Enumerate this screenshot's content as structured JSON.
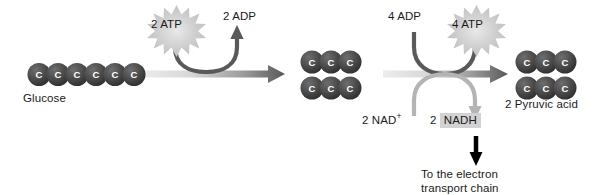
{
  "diagram": {
    "background_color": "#ffffff"
  },
  "molecules": {
    "glucose": {
      "name": "Glucose",
      "carbon_count": 6,
      "carbon_label": "C",
      "rows": 1
    },
    "intermediate": {
      "carbon_label": "C",
      "carbons_per_row": 3,
      "rows": 2
    },
    "pyruvic_acid": {
      "name": "2 Pyruvic acid",
      "carbon_label": "C",
      "carbons_per_row": 3,
      "rows": 2
    }
  },
  "reactions": {
    "atp_input": {
      "label": "2 ATP",
      "count": "2",
      "species": "ATP",
      "burst_color": "#c9c9c9"
    },
    "adp_output": {
      "label": "2 ADP",
      "count": "2",
      "species": "ADP"
    },
    "adp_input": {
      "label": "4 ADP",
      "count": "4",
      "species": "ADP"
    },
    "atp_output": {
      "label": "4 ATP",
      "count": "4",
      "species": "ATP",
      "burst_color": "#c9c9c9"
    },
    "nad_input": {
      "count": "2",
      "species": "NAD",
      "charge": "+",
      "label": "2 NAD+"
    },
    "nadh_output": {
      "count": "2",
      "species": "NADH",
      "label": "2 NADH",
      "highlight_color": "#d2d2d2"
    }
  },
  "annotations": {
    "electron_chain": {
      "line1": "To the electron",
      "line2": "transport chain"
    }
  },
  "colors": {
    "carbon_circle": "#4a4a4a",
    "carbon_circle_dark": "#2e2e2e",
    "carbon_text": "#ffffff",
    "main_arrow_light": "#e2e2e2",
    "main_arrow_dark": "#5c5c5c",
    "atp_curve": "#595959",
    "nad_curve": "#b4b4b4",
    "black_arrow": "#000000",
    "text": "#1a1a1a"
  }
}
